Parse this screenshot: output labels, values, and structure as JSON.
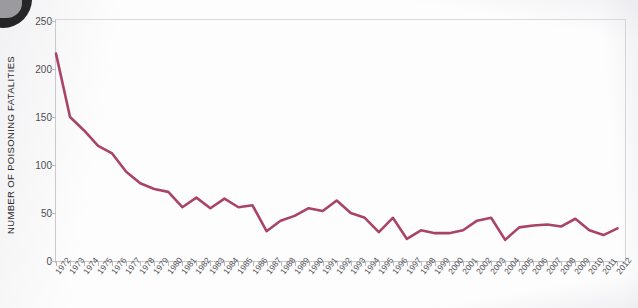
{
  "chart_data": {
    "type": "line",
    "title": "",
    "xlabel": "",
    "ylabel": "NUMBER OF POISONING FATALITIES",
    "ylim": [
      0,
      250
    ],
    "yticks": [
      0,
      50,
      100,
      150,
      200,
      250
    ],
    "grid": false,
    "legend": "none",
    "line_color": "#a94368",
    "categories": [
      "1972",
      "1973",
      "1974",
      "1975",
      "1976",
      "1977",
      "1978",
      "1979",
      "1980",
      "1981",
      "1982",
      "1983",
      "1984",
      "1985",
      "1986",
      "1987",
      "1988",
      "1989",
      "1990",
      "1991",
      "1992",
      "1993",
      "1994",
      "1995",
      "1996",
      "1997",
      "1998",
      "1999",
      "2000",
      "2001",
      "2002",
      "2003",
      "2004",
      "2005",
      "2006",
      "2007",
      "2008",
      "2009",
      "2010",
      "2011",
      "2012"
    ],
    "values": [
      216,
      150,
      136,
      120,
      112,
      93,
      81,
      75,
      72,
      56,
      66,
      55,
      65,
      56,
      58,
      31,
      42,
      47,
      55,
      52,
      63,
      50,
      45,
      30,
      45,
      23,
      32,
      29,
      29,
      32,
      42,
      45,
      22,
      35,
      37,
      38,
      36,
      44,
      32,
      27,
      34
    ]
  }
}
